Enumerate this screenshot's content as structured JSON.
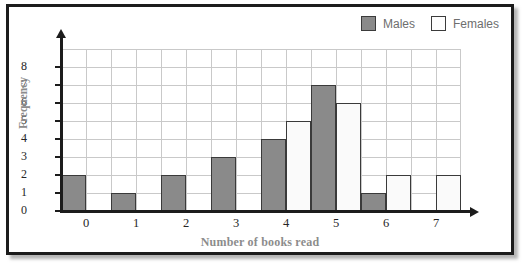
{
  "chart_data": {
    "type": "bar",
    "title": "",
    "xlabel": "Number of books read",
    "ylabel": "Frequency",
    "categories": [
      "0",
      "1",
      "2",
      "3",
      "4",
      "5",
      "6",
      "7"
    ],
    "series": [
      {
        "name": "Males",
        "color": "#8a8a8a",
        "values": [
          2,
          1,
          2,
          3,
          4,
          7,
          1,
          0
        ]
      },
      {
        "name": "Females",
        "color": "#fafafa",
        "values": [
          0,
          0,
          0,
          0,
          5,
          6,
          2,
          2
        ]
      }
    ],
    "ylim": [
      0,
      9
    ],
    "yticks": [
      "0",
      "1",
      "2",
      "3",
      "4",
      "5",
      "6",
      "7",
      "8"
    ],
    "grid": true,
    "legend_position": "top-right"
  },
  "legend": {
    "items": [
      {
        "label": "Males",
        "swatch": "filled-gray-square"
      },
      {
        "label": "Females",
        "swatch": "outlined-white-square"
      }
    ]
  },
  "axes": {
    "x_title": "Number of books read",
    "y_title": "Frequency"
  }
}
